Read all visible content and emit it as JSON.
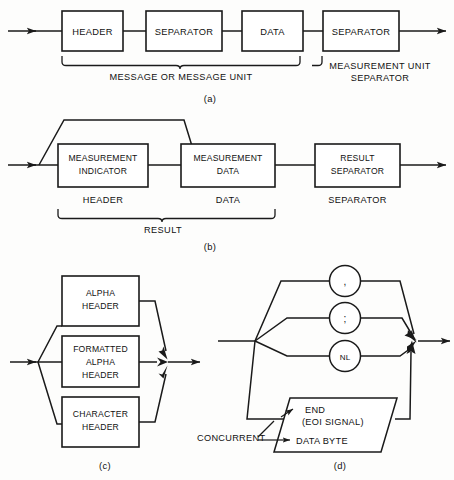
{
  "figure": {
    "background_color": "#fdfdfc",
    "line_color": "#1a1a1a"
  },
  "panel_a": {
    "caption": "(a)",
    "boxes": [
      {
        "label": "HEADER"
      },
      {
        "label": "SEPARATOR"
      },
      {
        "label": "DATA"
      },
      {
        "label": "SEPARATOR"
      }
    ],
    "brace_label": "MESSAGE OR MESSAGE UNIT",
    "side_label_line1": "MEASUREMENT UNIT",
    "side_label_line2": "SEPARATOR"
  },
  "panel_b": {
    "caption": "(b)",
    "boxes": [
      {
        "line1": "MEASUREMENT",
        "line2": "INDICATOR",
        "under_label": "HEADER"
      },
      {
        "line1": "MEASUREMENT",
        "line2": "DATA",
        "under_label": "DATA"
      },
      {
        "line1": "RESULT",
        "line2": "SEPARATOR",
        "under_label": "SEPARATOR"
      }
    ],
    "brace_label": "RESULT"
  },
  "panel_c": {
    "caption": "(c)",
    "boxes": [
      {
        "line1": "ALPHA",
        "line2": "HEADER",
        "line3": ""
      },
      {
        "line1": "FORMATTED",
        "line2": "ALPHA",
        "line3": "HEADER"
      },
      {
        "line1": "CHARACTER",
        "line2": "HEADER",
        "line3": ""
      }
    ]
  },
  "panel_d": {
    "caption": "(d)",
    "circles": [
      {
        "glyph": ",",
        "name": "comma"
      },
      {
        "glyph": ";",
        "name": "semicolon"
      },
      {
        "glyph": "NL",
        "name": "new-line"
      }
    ],
    "parallelogram": {
      "line1": "END",
      "line2": "(EOI SIGNAL)",
      "line3": "DATA BYTE"
    },
    "concurrent_label": "CONCURRENT"
  }
}
